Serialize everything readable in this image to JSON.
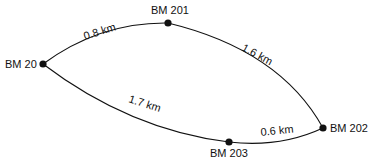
{
  "diagram": {
    "type": "level-network",
    "nodes": [
      {
        "id": "bm20",
        "label": "BM 20"
      },
      {
        "id": "bm201",
        "label": "BM 201"
      },
      {
        "id": "bm202",
        "label": "BM 202"
      },
      {
        "id": "bm203",
        "label": "BM 203"
      }
    ],
    "edges": [
      {
        "from": "bm20",
        "to": "bm201",
        "label": "0.8 km"
      },
      {
        "from": "bm201",
        "to": "bm202",
        "label": "1.6 km"
      },
      {
        "from": "bm20",
        "to": "bm203",
        "label": "1.7 km"
      },
      {
        "from": "bm203",
        "to": "bm202",
        "label": "0.6 km"
      }
    ],
    "colors": {
      "line": "#111111",
      "background": "#ffffff"
    }
  }
}
